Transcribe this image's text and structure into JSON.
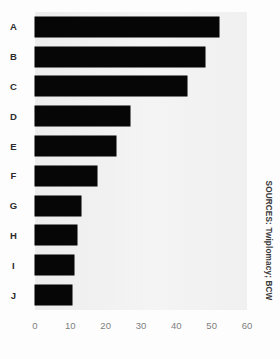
{
  "chart_data": {
    "type": "bar",
    "orientation": "horizontal",
    "title": "",
    "subtitle": "",
    "xlabel": "",
    "ylabel": "",
    "categories": [
      "A",
      "B",
      "C",
      "D",
      "E",
      "F",
      "G",
      "H",
      "I",
      "J"
    ],
    "values": [
      52,
      48,
      43,
      27,
      23,
      17.5,
      13,
      12,
      11,
      10.5
    ],
    "series": [
      {
        "name": "",
        "values": [
          52,
          48,
          43,
          27,
          23,
          17.5,
          13,
          12,
          11,
          10.5
        ]
      }
    ],
    "xlim": [
      0,
      60
    ],
    "xticks": [
      0,
      10,
      20,
      30,
      40,
      50,
      60
    ],
    "xtick_labels": [
      "0",
      "10",
      "20",
      "30",
      "40",
      "50",
      "60"
    ],
    "grid": false,
    "legend": false,
    "legend_position": "none",
    "bar_color": "#060606",
    "plot_background": "#f1f1f1",
    "page_background": "#fdfdfd",
    "tick_label_color": "#7d7d7d",
    "category_label_color": "#2b2b2b"
  },
  "annotations": {
    "source_credit": "SOURCES: Twiplomacy; BCW"
  }
}
